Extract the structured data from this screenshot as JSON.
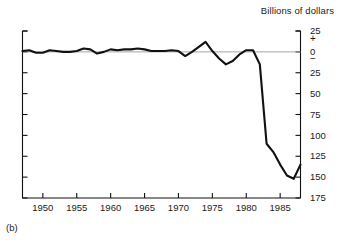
{
  "figure": {
    "panel_label": "(b)",
    "unit_title": "Billions of dollars"
  },
  "chart_data": {
    "type": "line",
    "title": "Billions of dollars",
    "xlabel": "",
    "ylabel": "Billions of dollars",
    "xlim": [
      1947,
      1988
    ],
    "ylim": [
      -175,
      25
    ],
    "y_axis_inverted_labels": true,
    "grid": false,
    "zero_line": true,
    "legend": "none",
    "axis_side": "right",
    "y_tick_labels": [
      "25",
      "+",
      "0",
      "−",
      "25",
      "50",
      "75",
      "100",
      "125",
      "150",
      "175"
    ],
    "y_tick_values": [
      25,
      0,
      0,
      0,
      -25,
      -50,
      -75,
      -100,
      -125,
      -150,
      -175
    ],
    "x_tick_labels": [
      "1950",
      "1955",
      "1960",
      "1965",
      "1970",
      "1975",
      "1980",
      "1985"
    ],
    "x_tick_values": [
      1950,
      1955,
      1960,
      1965,
      1970,
      1975,
      1980,
      1985
    ],
    "series": [
      {
        "name": "Federal budget surplus or deficit",
        "x": [
          1947,
          1948,
          1949,
          1950,
          1951,
          1952,
          1953,
          1954,
          1955,
          1956,
          1957,
          1958,
          1959,
          1960,
          1961,
          1962,
          1963,
          1964,
          1965,
          1966,
          1967,
          1968,
          1969,
          1970,
          1971,
          1972,
          1973,
          1974,
          1975,
          1976,
          1977,
          1978,
          1979,
          1980,
          1981,
          1982,
          1983,
          1984,
          1985,
          1986,
          1987,
          1988
        ],
        "values": [
          1,
          2,
          -1,
          -1,
          2,
          1,
          0,
          0,
          1,
          4,
          3,
          -2,
          0,
          3,
          2,
          3,
          3,
          4,
          3,
          1,
          1,
          1,
          2,
          1,
          -5,
          0,
          6,
          12,
          1,
          -8,
          -15,
          -11,
          -3,
          2,
          2,
          -15,
          -110,
          -120,
          -135,
          -148,
          -152,
          -135
        ],
        "color": "#111111",
        "line_width": 2.1
      }
    ]
  }
}
